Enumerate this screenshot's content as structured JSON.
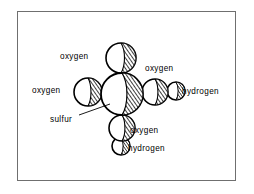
{
  "figure": {
    "molecule": "sulfuric acid",
    "frame": {
      "border_color": "#6f6f6f",
      "background_color": "#ffffff"
    },
    "ink_color": "#000000",
    "labels": {
      "oxygen_top": "oxygen",
      "oxygen_left": "oxygen",
      "oxygen_right": "oxygen",
      "hydrogen_right": "hydrogen",
      "sulfur": "sulfur",
      "oxygen_bottom": "oxygen",
      "hydrogen_bottom": "hydrogen"
    },
    "atoms": [
      {
        "name": "sulfur",
        "label": "sulfur",
        "cx": 122,
        "cy": 94,
        "r": 21
      },
      {
        "name": "oxygen-top",
        "label": "oxygen",
        "cx": 121,
        "cy": 58,
        "r": 15
      },
      {
        "name": "oxygen-left",
        "label": "oxygen",
        "cx": 88,
        "cy": 92,
        "r": 14
      },
      {
        "name": "oxygen-right",
        "label": "oxygen",
        "cx": 155,
        "cy": 92,
        "r": 13
      },
      {
        "name": "hydrogen-right",
        "label": "hydrogen",
        "cx": 176,
        "cy": 91,
        "r": 9
      },
      {
        "name": "oxygen-bottom",
        "label": "oxygen",
        "cx": 122,
        "cy": 128,
        "r": 13
      },
      {
        "name": "hydrogen-bottom",
        "label": "hydrogen",
        "cx": 121,
        "cy": 146,
        "r": 9
      }
    ],
    "leader_line": {
      "name": "sulfur-leader-line",
      "from_x": 79,
      "from_y": 115,
      "to_x": 110,
      "to_y": 104
    }
  }
}
